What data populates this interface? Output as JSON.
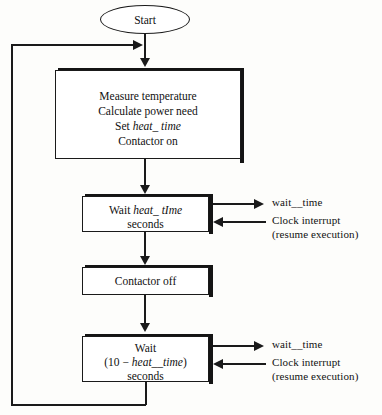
{
  "diagram": {
    "ink_color": "#1a1a1a",
    "background_color": "#fdfdfb"
  },
  "nodes": {
    "start": {
      "label": "Start"
    },
    "measure": {
      "line1": "Measure temperature",
      "line2": "Calculate power need",
      "line3_prefix": "Set ",
      "line3_italic": "heat_ time",
      "line4": "Contactor on"
    },
    "wait_heat": {
      "line1_prefix": "Wait ",
      "line1_italic": "heat_ tIme",
      "line2": "seconds"
    },
    "contactor_off": {
      "label": "Contactor off"
    },
    "wait_remainder": {
      "line1": "Wait",
      "line2_open": "(10 − ",
      "line2_italic": "heat__time",
      "line2_close": ")",
      "line3": "seconds"
    }
  },
  "side_labels": {
    "upper": {
      "out": "wait__time",
      "in_line1": "Clock interrupt",
      "in_line2": "(resume execution)"
    },
    "lower": {
      "out": "wait__time",
      "in_line1": "Clock interrupt",
      "in_line2": "(resume execution)"
    }
  }
}
